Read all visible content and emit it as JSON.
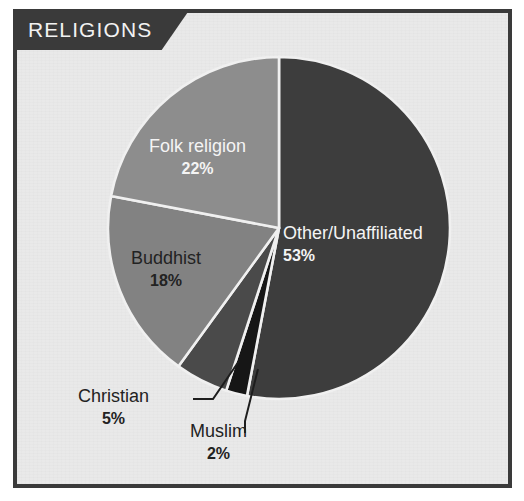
{
  "title": {
    "text": "RELIGIONS"
  },
  "colors": {
    "panel_background": "#e9e9e9",
    "frame": "#3a3a3a",
    "banner": "#3a3a3a",
    "banner_text": "#f2f2f2",
    "separator": "#f0f0f0",
    "label_light": "#f4f4f4",
    "label_dark": "#222222",
    "leader_line": "#1d1d1d"
  },
  "chart_data": {
    "type": "pie",
    "title": "RELIGIONS",
    "xlabel": "",
    "ylabel": "",
    "legend": "none",
    "start_angle_deg": 0,
    "direction": "clockwise",
    "units": "%",
    "categories": [
      "Other/Unaffiliated",
      "Muslim",
      "Christian",
      "Buddhist",
      "Folk religion"
    ],
    "values": [
      53,
      2,
      5,
      18,
      22
    ],
    "slices": [
      {
        "label": "Other/Unaffiliated",
        "value": 53,
        "value_text": "53%",
        "color": "#3d3d3d",
        "label_style": "light",
        "label_placement": "inside",
        "leader_line": false
      },
      {
        "label": "Muslim",
        "value": 2,
        "value_text": "2%",
        "color": "#161616",
        "label_style": "dark",
        "label_placement": "outside",
        "leader_line": true
      },
      {
        "label": "Christian",
        "value": 5,
        "value_text": "5%",
        "color": "#4a4a4a",
        "label_style": "dark",
        "label_placement": "outside",
        "leader_line": true
      },
      {
        "label": "Buddhist",
        "value": 18,
        "value_text": "18%",
        "color": "#828282",
        "label_style": "dark",
        "label_placement": "inside",
        "leader_line": false
      },
      {
        "label": "Folk religion",
        "value": 22,
        "value_text": "22%",
        "color": "#8d8d8d",
        "label_style": "light",
        "label_placement": "inside",
        "leader_line": false
      }
    ]
  }
}
